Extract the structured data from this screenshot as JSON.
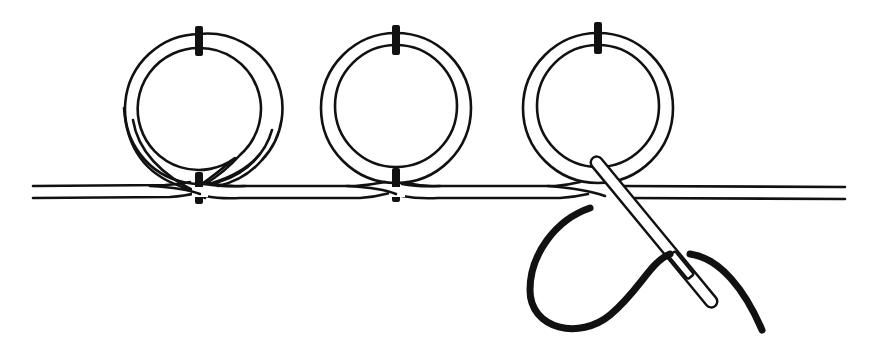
{
  "diagram": {
    "colors": {
      "ink": "#111111",
      "background": "#ffffff"
    },
    "elements": {
      "cord": {
        "description": "double-line laid cord running horizontally",
        "y_top": 186,
        "y_bottom": 198,
        "x_start": 33,
        "x_end": 845
      },
      "loops": [
        {
          "id": "loop-1",
          "cx": 199,
          "cy": 108,
          "outer_r": 75,
          "inner_r": 61,
          "tacks": [
            "top",
            "bottom"
          ]
        },
        {
          "id": "loop-2",
          "cx": 396,
          "cy": 108,
          "outer_r": 75,
          "inner_r": 61,
          "tacks": [
            "top",
            "bottom"
          ]
        },
        {
          "id": "loop-3",
          "cx": 598,
          "cy": 108,
          "outer_r": 75,
          "inner_r": 61,
          "tacks": [
            "top"
          ]
        }
      ],
      "needle": {
        "description": "needle passing under cord at third loop",
        "from": [
          592,
          156
        ],
        "to": [
          716,
          307
        ]
      },
      "thread": {
        "description": "thick working thread trailing from needle eye"
      }
    }
  }
}
